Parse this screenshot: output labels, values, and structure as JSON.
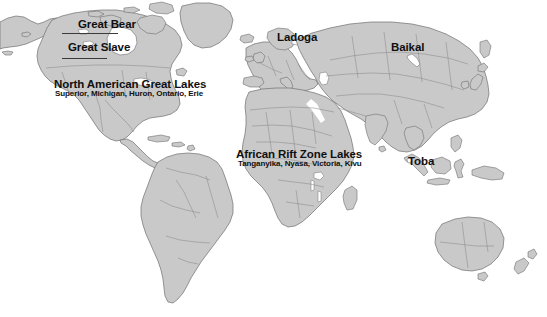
{
  "map": {
    "type": "world-lakes-reference-map",
    "projection": "robinson",
    "colors": {
      "land": "#c9c9c9",
      "land_outline": "#6e6e6e",
      "country_border": "#8a8a8a",
      "ocean": "#ffffff",
      "label_text": "#101010",
      "leader_line": "#3a3a3a"
    },
    "labels": [
      {
        "id": "great-bear",
        "title": "Great Bear",
        "subtitle": "",
        "region": "north-america",
        "has_leader_line": true
      },
      {
        "id": "great-slave",
        "title": "Great Slave",
        "subtitle": "",
        "region": "north-america",
        "has_leader_line": true
      },
      {
        "id": "north-american-great-lakes",
        "title": "North American Great Lakes",
        "subtitle": "Superior, Michigan, Huron, Ontario, Erie",
        "region": "north-america",
        "has_leader_line": false
      },
      {
        "id": "ladoga",
        "title": "Ladoga",
        "subtitle": "",
        "region": "europe",
        "has_leader_line": false
      },
      {
        "id": "baikal",
        "title": "Baikal",
        "subtitle": "",
        "region": "asia",
        "has_leader_line": false
      },
      {
        "id": "african-rift-zone-lakes",
        "title": "African Rift Zone Lakes",
        "subtitle": "Tanganyika, Nyasa, Victoria, Kivu",
        "region": "africa",
        "has_leader_line": false
      },
      {
        "id": "toba",
        "title": "Toba",
        "subtitle": "",
        "region": "southeast-asia",
        "has_leader_line": false
      }
    ]
  }
}
